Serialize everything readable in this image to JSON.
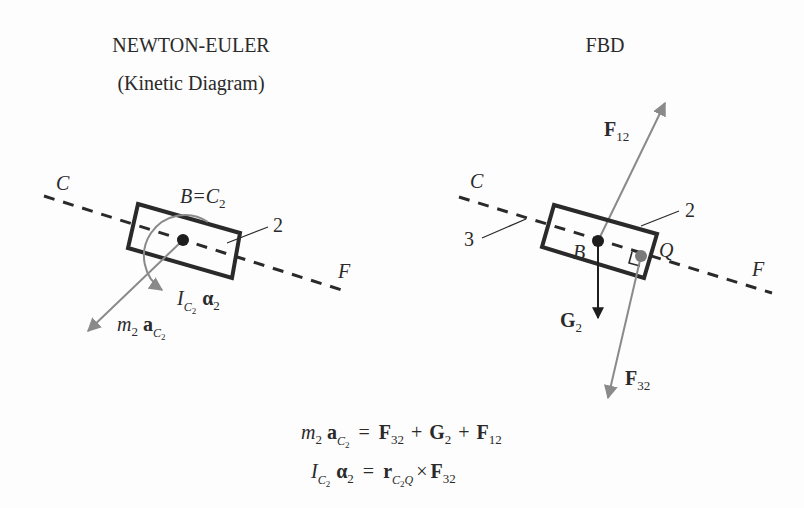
{
  "left_panel": {
    "title": "NEWTON-EULER",
    "subtitle": "(Kinetic Diagram)",
    "labels": {
      "C": "C",
      "F": "F",
      "point": "B=C",
      "point_sub": "2",
      "body": "2",
      "moment_I": "I",
      "moment_sub": "C",
      "moment_sub2": "2",
      "moment_alpha": "α",
      "moment_alpha_sub": "2",
      "inertia_m": "m",
      "inertia_m_sub": "2",
      "inertia_a": "a",
      "inertia_a_sub": "C",
      "inertia_a_sub2": "2"
    }
  },
  "right_panel": {
    "title": "FBD",
    "labels": {
      "C": "C",
      "F": "F",
      "ground": "3",
      "body": "2",
      "B": "B",
      "Q": "Q",
      "F12": "F",
      "F12_sub": "12",
      "G2": "G",
      "G2_sub": "2",
      "F32": "F",
      "F32_sub": "32"
    }
  },
  "equations": {
    "eq1": {
      "lhs_m": "m",
      "lhs_m_sub": "2",
      "lhs_a": "a",
      "lhs_a_sub": "C",
      "lhs_a_sub2": "2",
      "eq": "=",
      "t1": "F",
      "t1_sub": "32",
      "plus1": "+",
      "t2": "G",
      "t2_sub": "2",
      "plus2": "+",
      "t3": "F",
      "t3_sub": "12"
    },
    "eq2": {
      "lhs_I": "I",
      "lhs_I_sub": "C",
      "lhs_I_sub2": "2",
      "lhs_alpha": "α",
      "lhs_alpha_sub": "2",
      "eq": "=",
      "r": "r",
      "r_sub": "C",
      "r_sub2": "2",
      "r_sub3": "Q",
      "cross": "×",
      "t": "F",
      "t_sub": "32"
    }
  },
  "colors": {
    "ink": "#2a2a2a",
    "gray_arrow": "#8a8a8a",
    "dark_arrow": "#1e1e1e",
    "point_Q": "#7a7a7a"
  }
}
